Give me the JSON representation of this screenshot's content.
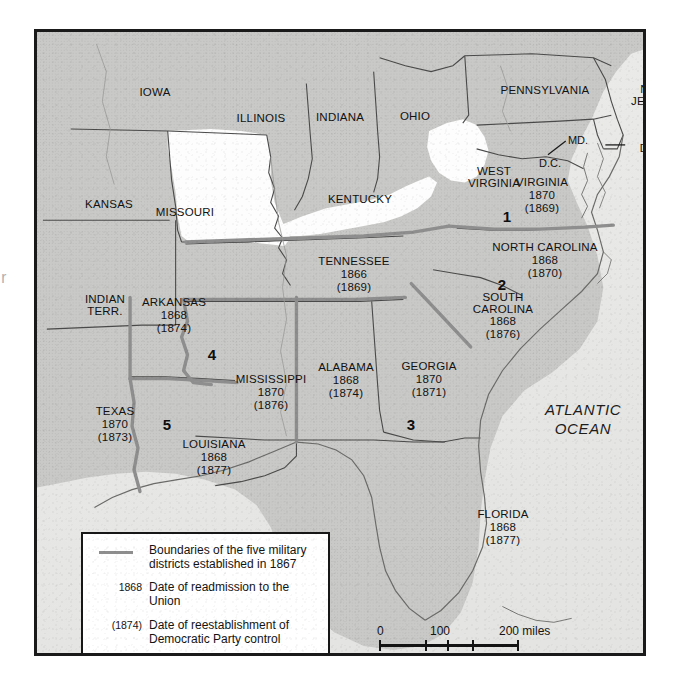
{
  "bleed_text": "r",
  "map": {
    "title_present": false,
    "ocean_label": "ATLANTIC\nOCEAN",
    "ocean_label_line1": "ATLANTIC",
    "ocean_label_line2": "OCEAN",
    "plain_states": [
      {
        "name": "IOWA",
        "x": 118,
        "y": 60
      },
      {
        "name": "ILLINOIS",
        "x": 224,
        "y": 86
      },
      {
        "name": "INDIANA",
        "x": 303,
        "y": 85
      },
      {
        "name": "OHIO",
        "x": 378,
        "y": 84
      },
      {
        "name": "PENNSYLVANIA",
        "x": 508,
        "y": 58
      },
      {
        "name": "KANSAS",
        "x": 72,
        "y": 172
      },
      {
        "name": "MISSOURI",
        "x": 148,
        "y": 180
      },
      {
        "name": "KENTUCKY",
        "x": 323,
        "y": 167
      }
    ],
    "two_line_states": [
      {
        "line1": "NEW",
        "line2": "JERSEY",
        "x": 617,
        "y": 63
      },
      {
        "line1": "WEST",
        "line2": "VIRGINIA",
        "x": 457,
        "y": 145
      },
      {
        "line1": "INDIAN",
        "line2": "TERR.",
        "x": 68,
        "y": 273
      }
    ],
    "tiny_labels": [
      {
        "name": "MD.",
        "x": 541,
        "y": 108
      },
      {
        "name": "D.C.",
        "x": 513,
        "y": 131
      },
      {
        "name": "DEL.",
        "x": 615,
        "y": 116
      }
    ],
    "reconstruction_states": [
      {
        "name": "VIRGINIA",
        "readmitted": "1870",
        "redeemed": "(1869)",
        "x": 505,
        "y": 163,
        "lines": 1
      },
      {
        "name": "NORTH CAROLINA",
        "readmitted": "1868",
        "redeemed": "(1870)",
        "x": 508,
        "y": 228,
        "lines": 1
      },
      {
        "name": "SOUTH CAROLINA",
        "readmitted": "1868",
        "redeemed": "(1876)",
        "x": 466,
        "y": 284,
        "lines": 2,
        "name_line1": "SOUTH",
        "name_line2": "CAROLINA"
      },
      {
        "name": "GEORGIA",
        "readmitted": "1870",
        "redeemed": "(1871)",
        "x": 392,
        "y": 347,
        "lines": 1
      },
      {
        "name": "FLORIDA",
        "readmitted": "1868",
        "redeemed": "(1877)",
        "x": 466,
        "y": 495,
        "lines": 1
      },
      {
        "name": "ALABAMA",
        "readmitted": "1868",
        "redeemed": "(1874)",
        "x": 309,
        "y": 348,
        "lines": 1
      },
      {
        "name": "MISSISSIPPI",
        "readmitted": "1870",
        "redeemed": "(1876)",
        "x": 234,
        "y": 360,
        "lines": 1
      },
      {
        "name": "TENNESSEE",
        "readmitted": "1866",
        "redeemed": "(1869)",
        "x": 317,
        "y": 242,
        "lines": 1
      },
      {
        "name": "ARKANSAS",
        "readmitted": "1868",
        "redeemed": "(1874)",
        "x": 137,
        "y": 283,
        "lines": 1
      },
      {
        "name": "LOUISIANA",
        "readmitted": "1868",
        "redeemed": "(1877)",
        "x": 177,
        "y": 425,
        "lines": 1
      },
      {
        "name": "TEXAS",
        "readmitted": "1870",
        "redeemed": "(1873)",
        "x": 78,
        "y": 392,
        "lines": 1
      }
    ],
    "military_districts": [
      {
        "number": "1",
        "x": 470,
        "y": 184
      },
      {
        "number": "2",
        "x": 465,
        "y": 252
      },
      {
        "number": "3",
        "x": 374,
        "y": 392
      },
      {
        "number": "4",
        "x": 175,
        "y": 322
      },
      {
        "number": "5",
        "x": 130,
        "y": 392
      }
    ]
  },
  "legend": {
    "rows": [
      {
        "key": "",
        "swatch": true,
        "text_line1": "Boundaries of the five military",
        "text_line2": "districts established in 1867"
      },
      {
        "key": "1868",
        "swatch": false,
        "text_line1": "Date of readmission to the Union",
        "text_line2": ""
      },
      {
        "key": "(1874)",
        "swatch": false,
        "text_line1": "Date of reestablishment of",
        "text_line2": "Democratic Party control"
      }
    ]
  },
  "scale_bar": {
    "miles_ticks": [
      "0",
      "100",
      "200 miles"
    ],
    "km_ticks": [
      "0",
      "100",
      "200 kilometers"
    ],
    "miles_label": "miles",
    "km_label": "kilometers"
  },
  "colors": {
    "confederate_fill": "#c9c9c7",
    "union_fill": "#fdfdfd",
    "ocean_fill": "#eaeae8",
    "district_line": "#8e8e8e",
    "state_line": "#4a4a4a",
    "frame": "#1a1a1a"
  }
}
